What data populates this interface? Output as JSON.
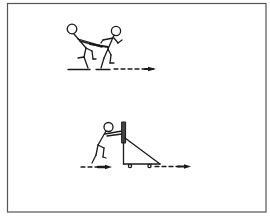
{
  "figure": {
    "background": "#ffffff",
    "stroke_color": "#1a1a1a",
    "border_color": "#555555",
    "panels": [
      {
        "id": "resisted-sprint",
        "description": "Two stick figures: rear figure leaning back holding a belt/strap attached to front figure who sprints forward; dashed arrow indicates direction of motion to the right",
        "elements": [
          "stick-figure-resistor",
          "stick-figure-sprinter",
          "harness-strap",
          "ground-lines",
          "direction-arrow"
        ]
      },
      {
        "id": "sled-push",
        "description": "Stick figure pushing a wheeled sled with upright post and triangular frame; dashed arrows indicate motion to the right",
        "elements": [
          "stick-figure-pusher",
          "sled-post",
          "sled-frame",
          "sled-wheels",
          "direction-arrows"
        ]
      }
    ]
  }
}
